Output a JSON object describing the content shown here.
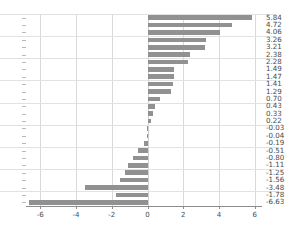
{
  "chart_data": {
    "type": "bar",
    "orientation": "horizontal",
    "title": "",
    "xlabel": "",
    "ylabel": "",
    "xlim": [
      -6.8,
      6.4
    ],
    "xticks": [
      -6,
      -4,
      -2,
      0,
      2,
      4,
      6
    ],
    "xtick_labels": [
      "-6",
      "-4",
      "-2",
      "0",
      "2",
      "4",
      "6"
    ],
    "grid": true,
    "legend": "none",
    "bar_color": "#919191",
    "zero_line": 0,
    "categories": [
      "SUR",
      "NIC",
      "BRB",
      "BOL",
      "BLZ",
      "HTI",
      "CRI",
      "VEN",
      "HND",
      "CHL",
      "DOM",
      "GTM",
      "TTO",
      "PAN",
      "SLV",
      "URY",
      "MEX",
      "BHS",
      "ARG",
      "JAM",
      "GUY",
      "PRY",
      "ECU",
      "PER",
      "COL",
      "BRA"
    ],
    "values": [
      5.84,
      4.72,
      4.06,
      3.26,
      3.21,
      2.38,
      2.28,
      1.49,
      1.47,
      1.41,
      1.29,
      0.7,
      0.43,
      0.33,
      0.22,
      -0.03,
      -0.04,
      -0.19,
      -0.51,
      -0.8,
      -1.11,
      -1.25,
      -1.56,
      -3.48,
      -1.78,
      -6.63
    ],
    "value_labels": [
      "5.84",
      "4.72",
      "4.06",
      "3.26",
      "3.21",
      "2.38",
      "2.28",
      "1.49",
      "1.47",
      "1.41",
      "1.29",
      "0.70",
      "0.43",
      "0.33",
      "0.22",
      "-0.03",
      "-0.04",
      "-0.19",
      "-0.51",
      "-0.80",
      "-1.11",
      "-1.25",
      "-1.56",
      "-3.48",
      "-1.78",
      "-6.63"
    ]
  }
}
